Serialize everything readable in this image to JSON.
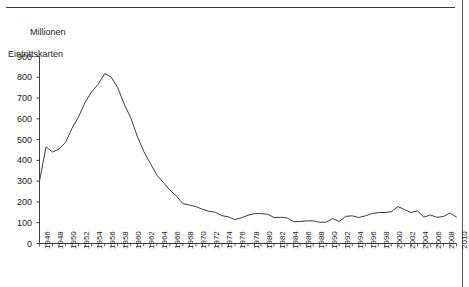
{
  "page": {
    "background_color": "#ffffff",
    "line_color": "#3c3c3c",
    "text_color": "#1a1a1a",
    "rule_color": "#3a3a3a"
  },
  "axis_title": {
    "line1": "Millionen",
    "line2": "Eintrittskarten"
  },
  "chart_data": {
    "type": "line",
    "title": "",
    "subtitle": "",
    "xlabel": "",
    "ylabel": "Millionen Eintrittskarten",
    "ylim": [
      0,
      900
    ],
    "xlim": [
      1946,
      2010
    ],
    "grid": false,
    "legend": "none",
    "y_ticks": [
      0,
      100,
      200,
      300,
      400,
      500,
      600,
      700,
      800,
      900
    ],
    "y_tick_labels": [
      "0",
      "100",
      "200",
      "300",
      "400",
      "500",
      "600",
      "700",
      "800",
      "900"
    ],
    "x_tick_step_years": 1,
    "x_tick_label_step_years": 2,
    "x_tick_labels": [
      "1946",
      "1948",
      "1950",
      "1952",
      "1954",
      "1956",
      "1958",
      "1960",
      "1962",
      "1964",
      "1966",
      "1968",
      "1970",
      "1972",
      "1974",
      "1976",
      "1978",
      "1980",
      "1982",
      "1984",
      "1986",
      "1988",
      "1990",
      "1992",
      "1994",
      "1996",
      "1998",
      "2000",
      "2002",
      "2004",
      "2006",
      "2008",
      "2010"
    ],
    "series": [
      {
        "name": "Eintrittskarten",
        "x": [
          1946,
          1947,
          1948,
          1949,
          1950,
          1951,
          1952,
          1953,
          1954,
          1955,
          1956,
          1957,
          1958,
          1959,
          1960,
          1961,
          1962,
          1963,
          1964,
          1965,
          1966,
          1967,
          1968,
          1969,
          1970,
          1971,
          1972,
          1973,
          1974,
          1975,
          1976,
          1977,
          1978,
          1979,
          1980,
          1981,
          1982,
          1983,
          1984,
          1985,
          1986,
          1987,
          1988,
          1989,
          1990,
          1991,
          1992,
          1993,
          1994,
          1995,
          1996,
          1997,
          1998,
          1999,
          2000,
          2001,
          2002,
          2003,
          2004,
          2005,
          2006,
          2007,
          2008,
          2009,
          2010
        ],
        "values": [
          300,
          465,
          440,
          455,
          487,
          555,
          610,
          680,
          730,
          766,
          818,
          801,
          750,
          671,
          605,
          517,
          443,
          386,
          330,
          294,
          257,
          229,
          192,
          185,
          178,
          165,
          155,
          150,
          134,
          128,
          115,
          124,
          136,
          144,
          144,
          141,
          125,
          126,
          123,
          105,
          106,
          109,
          109,
          102,
          103,
          120,
          106,
          131,
          133,
          125,
          133,
          144,
          149,
          149,
          153,
          178,
          164,
          149,
          157,
          127,
          137,
          126,
          130,
          147,
          127
        ]
      }
    ]
  }
}
